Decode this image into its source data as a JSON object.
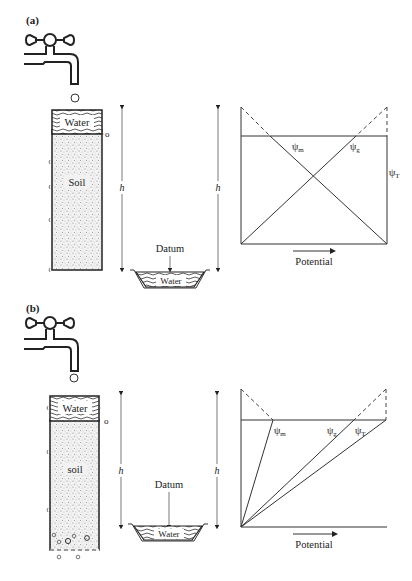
{
  "panels": [
    {
      "id": "a",
      "label": "(a)",
      "column": {
        "water_label": "Water",
        "soil_label": "Soil",
        "zero_mark": "o"
      },
      "height_label_left": "h",
      "height_label_right": "h",
      "datum_label": "Datum",
      "reservoir_label": "Water",
      "graph": {
        "psi_m": "ψ",
        "psi_m_sub": "m",
        "psi_g": "ψ",
        "psi_g_sub": "g",
        "psi_t": "ψ",
        "psi_t_sub": "T",
        "x_axis_label": "Potential"
      }
    },
    {
      "id": "b",
      "label": "(b)",
      "column": {
        "water_label": "Water",
        "soil_label": "soil",
        "zero_mark": "o"
      },
      "height_label_left": "h",
      "height_label_right": "h",
      "datum_label": "Datum",
      "reservoir_label": "Water",
      "graph": {
        "psi_m": "ψ",
        "psi_m_sub": "m",
        "psi_g": "ψ",
        "psi_g_sub": "g",
        "psi_t": "ψ",
        "psi_t_sub": "T",
        "x_axis_label": "Potential"
      }
    }
  ],
  "colors": {
    "ink": "#222222",
    "soil_fill": "#e8e8e8",
    "background": "#ffffff"
  }
}
